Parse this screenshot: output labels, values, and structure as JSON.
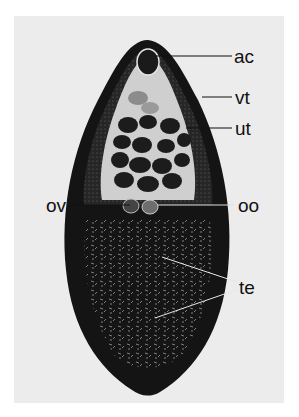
{
  "figure": {
    "labels": [
      {
        "id": "ac",
        "text": "ac",
        "meaning": "acetabulum"
      },
      {
        "id": "vt",
        "text": "vt",
        "meaning": "vitellaria"
      },
      {
        "id": "ut",
        "text": "ut",
        "meaning": "uterus"
      },
      {
        "id": "ov",
        "text": "ov",
        "meaning": "ovary"
      },
      {
        "id": "oo",
        "text": "oo",
        "meaning": "ootype"
      },
      {
        "id": "te",
        "text": "te",
        "meaning": "testes"
      }
    ],
    "colors": {
      "background": "#ececec",
      "body": "#141414",
      "tegument": "#2a2a2a",
      "interior": "#c9c9c9",
      "label": "#111111"
    }
  }
}
